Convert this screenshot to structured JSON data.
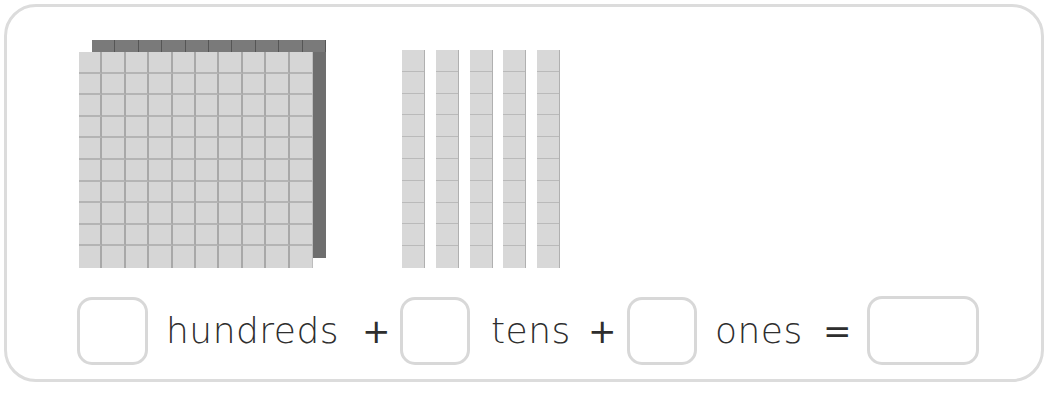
{
  "worksheet": {
    "colors": {
      "frame_border": "#dcdcdc",
      "block_face": "#d6d6d6",
      "block_grid": "#a8a8a8",
      "block_shadow": "#6e6e6e",
      "text": "#2e2e2e",
      "box_border": "#d8d8d8"
    },
    "blocks": {
      "hundreds_flats": 1,
      "tens_rods": 5,
      "ones_units": 0
    },
    "equation": {
      "hundreds_box_value": "",
      "hundreds_label": "hundreds",
      "plus_1": "+",
      "tens_box_value": "",
      "tens_label": "tens",
      "plus_2": "+",
      "ones_box_value": "",
      "ones_label": "ones",
      "equals": "=",
      "total_box_value": ""
    }
  }
}
